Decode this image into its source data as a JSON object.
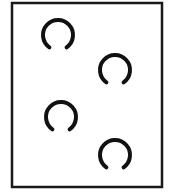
{
  "diagram": {
    "frame": {
      "x": 12,
      "y": 3,
      "width": 150,
      "height": 184,
      "stroke": "#1a1a1a",
      "stroke_width": 2.5
    },
    "arc_style": {
      "stroke": "#111111",
      "stroke_width": 4,
      "radius": 15,
      "gap_direction": "bottom",
      "gap_degrees": 70
    },
    "rings": [
      {
        "id": "ring-1",
        "cx": 58,
        "cy": 35
      },
      {
        "id": "ring-2",
        "cx": 115,
        "cy": 70
      },
      {
        "id": "ring-3",
        "cx": 61,
        "cy": 117
      },
      {
        "id": "ring-4",
        "cx": 115,
        "cy": 155
      }
    ]
  }
}
